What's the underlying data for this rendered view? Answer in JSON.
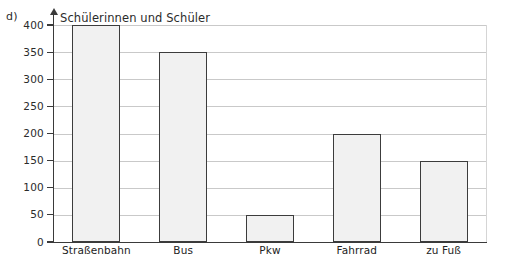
{
  "figure": {
    "part_label": "d)",
    "axis_title": "Schülerinnen und Schüler"
  },
  "chart_data": {
    "type": "bar",
    "title": "",
    "subtitle": "",
    "xlabel": "",
    "ylabel": "Schülerinnen und Schüler",
    "categories": [
      "Straßenbahn",
      "Bus",
      "Pkw",
      "Fahrrad",
      "zu Fuß"
    ],
    "values": [
      400,
      350,
      50,
      200,
      150
    ],
    "ylim": [
      0,
      400
    ],
    "ytick_labels": [
      "0",
      "50",
      "100",
      "150",
      "200",
      "250",
      "300",
      "350",
      "400"
    ],
    "ytick_values": [
      0,
      50,
      100,
      150,
      200,
      250,
      300,
      350,
      400
    ],
    "grid": "horizontal",
    "legend": "none",
    "colors": {
      "bar_fill": "#f1f1f1",
      "bar_stroke": "#3c3c3c",
      "gridline": "#c9c9c9",
      "axis": "#3a3a3a",
      "text": "#222222"
    }
  }
}
